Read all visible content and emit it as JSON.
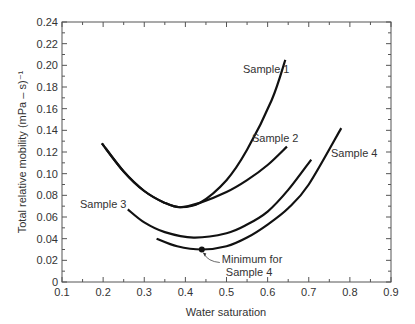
{
  "chart_data": {
    "type": "line",
    "title": "",
    "xlabel": "Water saturation",
    "ylabel": "Total relative mobility (mPa – s)⁻¹",
    "xlim": [
      0.1,
      0.9
    ],
    "ylim": [
      0,
      0.24
    ],
    "xticks": [
      "0.1",
      "0.2",
      "0.3",
      "0.4",
      "0.5",
      "0.6",
      "0.7",
      "0.8",
      "0.9"
    ],
    "yticks": [
      "0",
      "0.02",
      "0.04",
      "0.06",
      "0.08",
      "0.10",
      "0.12",
      "0.14",
      "0.16",
      "0.18",
      "0.20",
      "0.22",
      "0.24"
    ],
    "grid": false,
    "legend": "none (inline labels)",
    "series": [
      {
        "name": "Sample 1",
        "x": [
          0.197,
          0.25,
          0.3,
          0.35,
          0.387,
          0.435,
          0.5,
          0.55,
          0.61,
          0.643
        ],
        "y": [
          0.128,
          0.102,
          0.084,
          0.073,
          0.069,
          0.073,
          0.094,
          0.122,
          0.168,
          0.205
        ]
      },
      {
        "name": "Sample 2",
        "x": [
          0.197,
          0.25,
          0.3,
          0.35,
          0.387,
          0.435,
          0.5,
          0.55,
          0.6,
          0.647
        ],
        "y": [
          0.128,
          0.102,
          0.084,
          0.073,
          0.069,
          0.073,
          0.083,
          0.094,
          0.108,
          0.125
        ]
      },
      {
        "name": "Sample 3",
        "x": [
          0.26,
          0.3,
          0.35,
          0.42,
          0.5,
          0.55,
          0.6,
          0.65,
          0.706
        ],
        "y": [
          0.067,
          0.055,
          0.046,
          0.041,
          0.045,
          0.053,
          0.065,
          0.085,
          0.113
        ]
      },
      {
        "name": "Sample 4",
        "x": [
          0.33,
          0.38,
          0.44,
          0.5,
          0.55,
          0.6,
          0.65,
          0.7,
          0.779
        ],
        "y": [
          0.04,
          0.033,
          0.03,
          0.033,
          0.041,
          0.053,
          0.068,
          0.09,
          0.142
        ]
      }
    ],
    "annotations": [
      {
        "text": "Minimum for",
        "text2": "Sample 4",
        "x": 0.44,
        "y": 0.03
      }
    ],
    "labels": [
      {
        "text": "Sample 1",
        "px": 243,
        "py": 73
      },
      {
        "text": "Sample 2",
        "px": 252,
        "py": 142
      },
      {
        "text": "Sample 3",
        "px": 80,
        "py": 208
      },
      {
        "text": "Sample 4",
        "px": 331,
        "py": 157
      }
    ]
  }
}
